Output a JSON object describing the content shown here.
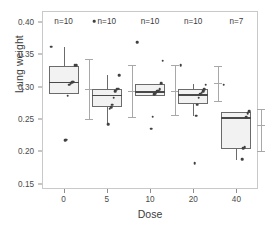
{
  "chart_data": {
    "type": "box",
    "title": "",
    "xlabel": "Dose",
    "ylabel": "Lung weight",
    "grid": false,
    "legend": null,
    "categories": [
      "0",
      "5",
      "10",
      "20",
      "40"
    ],
    "xtick_labels": [
      "0",
      "5",
      "10",
      "20",
      "40"
    ],
    "ytick_labels": [
      "0.15",
      "0.20",
      "0.25",
      "0.30",
      "0.35",
      "0.40"
    ],
    "ytick_values": [
      0.15,
      0.2,
      0.25,
      0.3,
      0.35,
      0.4
    ],
    "ylim": [
      0.142,
      0.417
    ],
    "annotations": [
      "n=10",
      "n=10",
      "n=10",
      "n=10",
      "n=7"
    ],
    "groups": [
      {
        "category": "0",
        "n_label": "n=10",
        "n": 10,
        "box": {
          "q1": 0.288,
          "median": 0.3075,
          "q3": 0.3325
        },
        "whisker": {
          "low": 0.288,
          "high": 0.362
        },
        "interval": {
          "low": 0.2505,
          "mean": 0.2965,
          "high": 0.3425
        },
        "points": [
          0.362,
          0.333,
          0.333,
          0.308,
          0.307,
          0.305,
          0.303,
          0.286,
          0.218,
          0.217
        ]
      },
      {
        "category": "5",
        "n_label": "n=10",
        "n": 10,
        "box": {
          "q1": 0.2685,
          "median": 0.2875,
          "q3": 0.2965
        },
        "whisker": {
          "low": 0.2425,
          "high": 0.3185
        },
        "interval": {
          "low": 0.2525,
          "mean": 0.293,
          "high": 0.334
        },
        "points": [
          0.401,
          0.318,
          0.297,
          0.296,
          0.293,
          0.283,
          0.272,
          0.268,
          0.266,
          0.242
        ]
      },
      {
        "category": "10",
        "n_label": "n=10",
        "n": 10,
        "box": {
          "q1": 0.2855,
          "median": 0.2935,
          "q3": 0.3035
        },
        "whisker": {
          "low": 0.2855,
          "high": 0.3035
        },
        "interval": {
          "low": 0.257,
          "mean": 0.293,
          "high": 0.333
        },
        "points": [
          0.369,
          0.34,
          0.305,
          0.296,
          0.294,
          0.293,
          0.29,
          0.288,
          0.254,
          0.235
        ]
      },
      {
        "category": "20",
        "n_label": "n=10",
        "n": 10,
        "box": {
          "q1": 0.2735,
          "median": 0.2885,
          "q3": 0.2965
        },
        "whisker": {
          "low": 0.2545,
          "high": 0.3035
        },
        "interval": {
          "low": 0.2785,
          "mean": 0.3055,
          "high": 0.3325
        },
        "points": [
          0.333,
          0.303,
          0.296,
          0.293,
          0.291,
          0.288,
          0.283,
          0.272,
          0.255,
          0.182
        ]
      },
      {
        "category": "40",
        "n_label": "n=7",
        "n": 7,
        "box": {
          "q1": 0.2035,
          "median": 0.2525,
          "q3": 0.2605
        },
        "whisker": {
          "low": 0.1875,
          "high": 0.2605
        },
        "interval": {
          "low": 0.2005,
          "mean": 0.2405,
          "high": 0.2655
        },
        "points": [
          0.303,
          0.262,
          0.259,
          0.253,
          0.207,
          0.205,
          0.188
        ]
      }
    ]
  }
}
